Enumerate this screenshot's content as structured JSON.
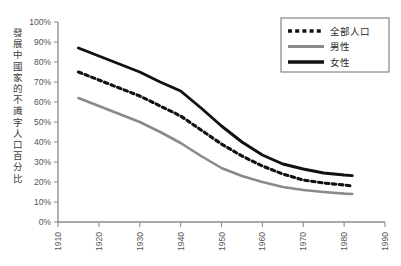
{
  "chart_data": {
    "type": "line",
    "title": "",
    "xlabel": "",
    "ylabel": "發展中國家的不識字人口百分比",
    "xlim": [
      1910,
      1990
    ],
    "ylim": [
      0,
      100
    ],
    "grid": false,
    "legend_position": "top-right",
    "x_tick_labels": [
      "1910",
      "1920",
      "1930",
      "1940",
      "1950",
      "1960",
      "1970",
      "1980",
      "1990"
    ],
    "x_ticks": [
      1910,
      1920,
      1930,
      1940,
      1950,
      1960,
      1970,
      1980,
      1990
    ],
    "y_tick_labels": [
      "0%",
      "10%",
      "20%",
      "30%",
      "40%",
      "50%",
      "60%",
      "70%",
      "80%",
      "90%",
      "100%"
    ],
    "y_ticks": [
      0,
      10,
      20,
      30,
      40,
      50,
      60,
      70,
      80,
      90,
      100
    ],
    "x": [
      1915,
      1920,
      1925,
      1930,
      1935,
      1940,
      1945,
      1950,
      1955,
      1960,
      1965,
      1970,
      1975,
      1980,
      1982
    ],
    "series": [
      {
        "name": "全部人口",
        "style": "dotted",
        "color": "#111111",
        "values": [
          75,
          71,
          67,
          63,
          58,
          53,
          46,
          39,
          33,
          28,
          24,
          21,
          19.5,
          18.5,
          18
        ]
      },
      {
        "name": "男性",
        "style": "solid",
        "color": "#8a8a8a",
        "values": [
          62,
          58,
          54,
          50,
          45,
          39.5,
          33,
          27,
          23,
          20,
          17.5,
          16,
          15,
          14.2,
          14
        ]
      },
      {
        "name": "女性",
        "style": "solid",
        "color": "#111111",
        "values": [
          87,
          83,
          79,
          75,
          70,
          65.5,
          57,
          48,
          40,
          33.5,
          29,
          26.5,
          24.5,
          23.5,
          23.2
        ]
      }
    ]
  },
  "legend": {
    "items": [
      {
        "label": "全部人口",
        "swatch": "dotted-black"
      },
      {
        "label": "男性",
        "swatch": "solid-gray"
      },
      {
        "label": "女性",
        "swatch": "solid-black"
      }
    ]
  },
  "colors": {
    "axis": "#8d8d8d",
    "all_population": "#111111",
    "male": "#8a8a8a",
    "female": "#111111",
    "background": "#ffffff"
  }
}
